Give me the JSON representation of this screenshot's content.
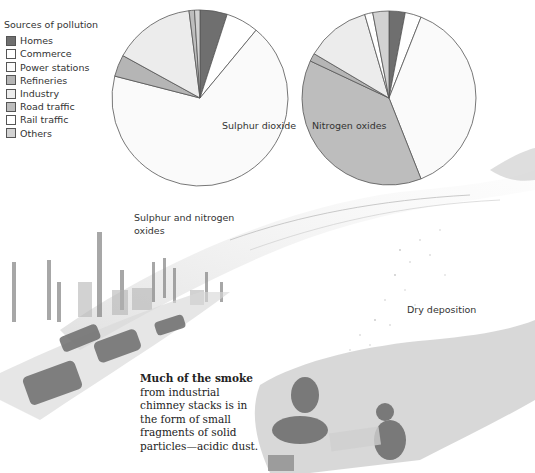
{
  "legend": {
    "title": "Sources of pollution",
    "items": [
      {
        "label": "Homes",
        "color": "#6f6f6f"
      },
      {
        "label": "Commerce",
        "color": "#ffffff"
      },
      {
        "label": "Power stations",
        "color": "#fafafa"
      },
      {
        "label": "Refineries",
        "color": "#b5b5b5"
      },
      {
        "label": "Industry",
        "color": "#ececec"
      },
      {
        "label": "Road traffic",
        "color": "#bdbdbd"
      },
      {
        "label": "Rail traffic",
        "color": "#ffffff"
      },
      {
        "label": "Others",
        "color": "#d2d2d2"
      }
    ]
  },
  "labels": {
    "so2": "Sulphur dioxide",
    "nox": "Nitrogen oxides",
    "oxides_line1": "Sulphur and nitrogen",
    "oxides_line2": "oxides",
    "dry_deposition": "Dry deposition"
  },
  "body_text": {
    "lead": "Much of the smoke",
    "rest": "from industrial chimney stacks is in the form of small fragments of solid particles—acidic dust."
  },
  "chart_data": [
    {
      "type": "pie",
      "title": "Sulphur dioxide",
      "categories": [
        "Homes",
        "Commerce",
        "Power stations",
        "Refineries",
        "Industry",
        "Road traffic",
        "Rail traffic",
        "Others"
      ],
      "values": [
        5,
        6,
        68,
        4,
        15,
        1,
        0,
        1
      ],
      "unit": "% (estimated)",
      "center": [
        200,
        98
      ],
      "radius": 88
    },
    {
      "type": "pie",
      "title": "Nitrogen oxides",
      "categories": [
        "Homes",
        "Commerce",
        "Power stations",
        "Road traffic",
        "Refineries",
        "Industry",
        "Rail traffic",
        "Others"
      ],
      "values": [
        3,
        3,
        38,
        38,
        1.5,
        12,
        1.5,
        3
      ],
      "unit": "% (estimated)",
      "center": [
        389,
        98
      ],
      "radius": 87
    }
  ]
}
